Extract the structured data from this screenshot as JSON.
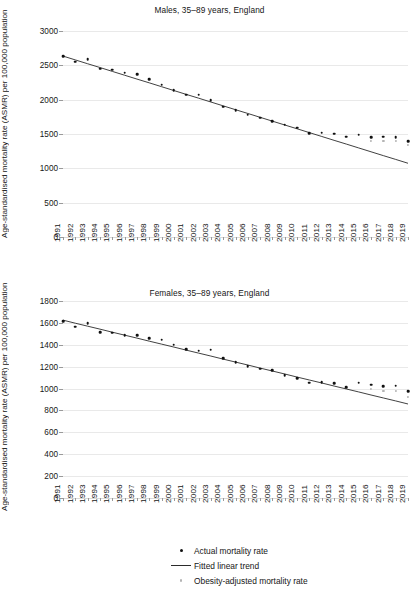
{
  "figure": {
    "ylabel": "Age-standardised mortality rate (ASMR) per 100,000 population",
    "legend": [
      {
        "marker": "dot-black",
        "label": "Actual mortality rate"
      },
      {
        "marker": "line",
        "label": "Fitted linear trend"
      },
      {
        "marker": "dot-gray",
        "label": "Obesity-adjusted mortality rate"
      }
    ]
  },
  "chart_data": [
    {
      "type": "scatter",
      "title": "Males, 35–89 years, England",
      "xlabel": "",
      "ylabel": "Age-standardised mortality rate (ASMR) per 100,000 population",
      "ylim": [
        0,
        3000
      ],
      "yticks": [
        0,
        500,
        1000,
        1500,
        2000,
        2500,
        3000
      ],
      "grid": true,
      "legend_position": "below-figure",
      "x": [
        1991,
        1992,
        1993,
        1994,
        1995,
        1996,
        1997,
        1998,
        1999,
        2000,
        2001,
        2002,
        2003,
        2004,
        2005,
        2006,
        2007,
        2008,
        2009,
        2010,
        2011,
        2012,
        2013,
        2014,
        2015,
        2016,
        2017,
        2018,
        2019
      ],
      "series": [
        {
          "name": "Actual mortality rate",
          "values": [
            2630,
            2555,
            2585,
            2450,
            2435,
            2390,
            2370,
            2300,
            2220,
            2135,
            2075,
            2075,
            1995,
            1900,
            1845,
            1780,
            1735,
            1690,
            1635,
            1590,
            1515,
            1520,
            1505,
            1460,
            1490,
            1455,
            1460,
            1455,
            1395
          ]
        },
        {
          "name": "Fitted linear trend",
          "values": [
            2635,
            2579,
            2523,
            2468,
            2412,
            2356,
            2300,
            2245,
            2189,
            2133,
            2077,
            2022,
            1966,
            1910,
            1854,
            1799,
            1743,
            1687,
            1631,
            1576,
            1520,
            1464,
            1408,
            1353,
            1297,
            1241,
            1185,
            1130,
            1074
          ]
        },
        {
          "name": "Obesity-adjusted mortality rate",
          "values": [
            null,
            null,
            null,
            null,
            null,
            null,
            null,
            null,
            null,
            null,
            null,
            null,
            null,
            null,
            null,
            null,
            null,
            null,
            null,
            null,
            null,
            null,
            null,
            null,
            null,
            1400,
            1400,
            1395,
            1345
          ]
        }
      ]
    },
    {
      "type": "scatter",
      "title": "Females, 35–89 years, England",
      "xlabel": "",
      "ylabel": "Age-standardised mortality rate (ASMR) per 100,000 population",
      "ylim": [
        0,
        1800
      ],
      "yticks": [
        0,
        200,
        400,
        600,
        800,
        1000,
        1200,
        1400,
        1600,
        1800
      ],
      "grid": true,
      "legend_position": "below-figure",
      "x": [
        1991,
        1992,
        1993,
        1994,
        1995,
        1996,
        1997,
        1998,
        1999,
        2000,
        2001,
        2002,
        2003,
        2004,
        2005,
        2006,
        2007,
        2008,
        2009,
        2010,
        2011,
        2012,
        2013,
        2014,
        2015,
        2016,
        2017,
        2018,
        2019
      ],
      "series": [
        {
          "name": "Actual mortality rate",
          "values": [
            1615,
            1565,
            1595,
            1515,
            1510,
            1490,
            1485,
            1460,
            1445,
            1400,
            1360,
            1345,
            1355,
            1275,
            1240,
            1205,
            1180,
            1170,
            1120,
            1095,
            1055,
            1060,
            1050,
            1015,
            1055,
            1035,
            1020,
            1025,
            975
          ]
        },
        {
          "name": "Fitted linear trend",
          "values": [
            1625,
            1597,
            1570,
            1543,
            1515,
            1488,
            1461,
            1433,
            1406,
            1379,
            1351,
            1324,
            1297,
            1269,
            1242,
            1215,
            1187,
            1160,
            1133,
            1105,
            1078,
            1051,
            1023,
            996,
            969,
            941,
            914,
            887,
            859
          ]
        },
        {
          "name": "Obesity-adjusted mortality rate",
          "values": [
            null,
            null,
            null,
            null,
            null,
            null,
            null,
            null,
            null,
            null,
            null,
            null,
            null,
            null,
            null,
            null,
            null,
            null,
            null,
            null,
            null,
            null,
            null,
            null,
            null,
            995,
            975,
            975,
            925
          ]
        }
      ]
    }
  ]
}
